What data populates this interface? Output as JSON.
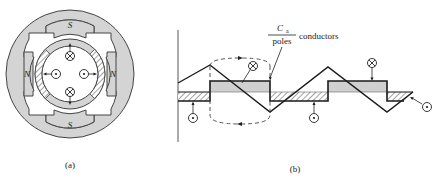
{
  "panel_a": {
    "caption": "(a)",
    "poles": [
      {
        "label": "S",
        "position": "top"
      },
      {
        "label": "N",
        "position": "left"
      },
      {
        "label": "N",
        "position": "right"
      },
      {
        "label": "S",
        "position": "bottom"
      }
    ],
    "conductors": [
      {
        "symbol": "cross",
        "position": "top",
        "meaning": "into page"
      },
      {
        "symbol": "dot",
        "position": "left",
        "meaning": "out of page"
      },
      {
        "symbol": "dot",
        "position": "right",
        "meaning": "out of page"
      },
      {
        "symbol": "cross",
        "position": "bottom",
        "meaning": "into page"
      }
    ]
  },
  "panel_b": {
    "caption": "(b)",
    "annotation": {
      "numerator": "C",
      "numerator_sub": "a",
      "denominator": "poles",
      "suffix": "conductors"
    },
    "conductor_markers": [
      {
        "symbol": "cross",
        "region": "gray block 1"
      },
      {
        "symbol": "dot",
        "region": "hatched band 1"
      },
      {
        "symbol": "dot",
        "region": "hatched band 2"
      },
      {
        "symbol": "cross",
        "region": "gray block 2"
      },
      {
        "symbol": "dot",
        "region": "hatched band 3"
      }
    ]
  },
  "colors": {
    "stroke": "#1a1a1a",
    "pole_fill": "#d4d4d4",
    "block_fill": "#d0d0d0",
    "background": "#ffffff"
  }
}
